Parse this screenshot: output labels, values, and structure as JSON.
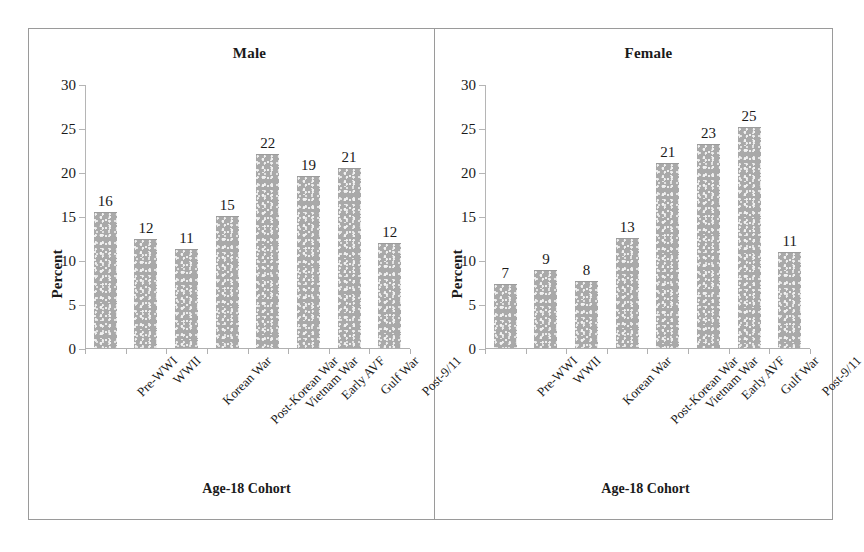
{
  "figure": {
    "frame_color": "#9a9a9a",
    "bar_color": "#a9a9a9"
  },
  "chart_data": [
    {
      "type": "bar",
      "title": "Male",
      "xlabel": "Age-18 Cohort",
      "ylabel": "Percent",
      "ylim": [
        0,
        30
      ],
      "yticks": [
        0,
        5,
        10,
        15,
        20,
        25,
        30
      ],
      "grid": false,
      "legend": null,
      "categories": [
        "Pre-WWI",
        "WWII",
        "Korean War",
        "Post-Korean War",
        "Vietnam War",
        "Early AVF",
        "Gulf War",
        "Post-9/11"
      ],
      "values": [
        15.4,
        12.4,
        11.3,
        15.0,
        22.0,
        19.5,
        20.4,
        11.9
      ],
      "labels": [
        "16",
        "12",
        "11",
        "15",
        "22",
        "19",
        "21",
        "12"
      ]
    },
    {
      "type": "bar",
      "title": "Female",
      "xlabel": "Age-18 Cohort",
      "ylabel": "Percent",
      "ylim": [
        0,
        30
      ],
      "yticks": [
        0,
        5,
        10,
        15,
        20,
        25,
        30
      ],
      "grid": false,
      "legend": null,
      "categories": [
        "Pre-WWI",
        "WWII",
        "Korean War",
        "Post-Korean War",
        "Vietnam War",
        "Early AVF",
        "Gulf War",
        "Post-9/11"
      ],
      "values": [
        7.3,
        8.9,
        7.6,
        12.5,
        21.0,
        23.2,
        25.1,
        10.9
      ],
      "labels": [
        "7",
        "9",
        "8",
        "13",
        "21",
        "23",
        "25",
        "11"
      ]
    }
  ]
}
